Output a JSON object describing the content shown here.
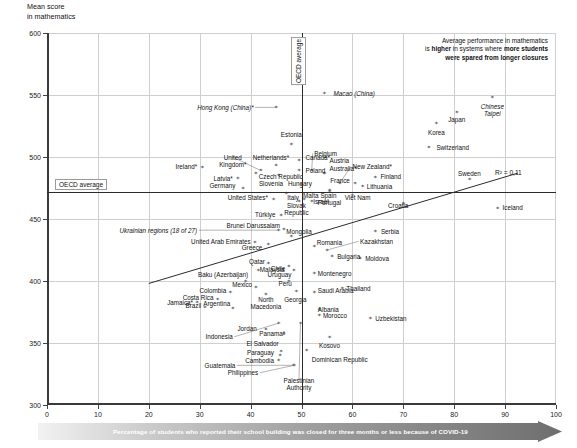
{
  "axes": {
    "y_title": "Mean score\nin mathematics",
    "y_ticks": [
      300,
      350,
      400,
      450,
      500,
      550,
      600
    ],
    "x_ticks": [
      0,
      10,
      20,
      30,
      40,
      50,
      60,
      70,
      80,
      90,
      100
    ],
    "ylim": [
      300,
      600
    ],
    "xlim": [
      0,
      100
    ]
  },
  "labels": {
    "oecd_average_y": "OECD average",
    "oecd_average_x": "OECD average",
    "r2": "R² = 0,11",
    "annotation_line1": "Average performance in mathematics",
    "annotation_line2_a": "is ",
    "annotation_line2_b": "higher",
    "annotation_line2_c": " in systems where ",
    "annotation_line2_d": "more students",
    "annotation_line3": "were spared from longer closures",
    "caption": "Percentage of students who reported their school building was closed for three months or less because of COVID-19"
  },
  "chart_data": {
    "type": "scatter",
    "title": "",
    "xlabel": "Percentage of students who reported their school building was closed for three months or less because of COVID-19",
    "ylabel": "Mean score in mathematics",
    "xlim": [
      0,
      100
    ],
    "ylim": [
      300,
      600
    ],
    "grid": true,
    "legend": "none",
    "oecd_average_x": 50.0,
    "oecd_average_y": 472,
    "trendline": {
      "x0": 20.0,
      "y0": 398,
      "x1": 92.5,
      "y1": 487,
      "r_squared": 0.11
    },
    "points": [
      {
        "name": "Hong Kong (China)*",
        "x": 45.0,
        "y": 540,
        "lx": 40.6,
        "ly": 540,
        "align": "right",
        "italic": true
      },
      {
        "name": "Macao (China)",
        "x": 54.5,
        "y": 551,
        "lx": 56.3,
        "ly": 551,
        "align": "left",
        "italic": true
      },
      {
        "name": "Chinese Taipei",
        "x": 87.5,
        "y": 548,
        "lx": 87.5,
        "ly": 541,
        "align": "center",
        "italic": true
      },
      {
        "name": "Korea",
        "x": 76.5,
        "y": 527,
        "lx": 76.5,
        "ly": 520,
        "align": "center",
        "italic": false
      },
      {
        "name": "Japan",
        "x": 80.5,
        "y": 536,
        "lx": 80.5,
        "ly": 530,
        "align": "center",
        "italic": false
      },
      {
        "name": "Estonia",
        "x": 48.0,
        "y": 510,
        "lx": 48.0,
        "ly": 518,
        "align": "center",
        "italic": false
      },
      {
        "name": "Switzerland",
        "x": 75.0,
        "y": 508,
        "lx": 76.5,
        "ly": 508,
        "align": "left",
        "italic": false
      },
      {
        "name": "Canada*",
        "x": 49.5,
        "y": 497,
        "lx": 50.8,
        "ly": 500,
        "align": "left",
        "italic": false
      },
      {
        "name": "Netherlands*",
        "x": 45.0,
        "y": 493,
        "lx": 44.0,
        "ly": 500,
        "align": "center",
        "italic": false
      },
      {
        "name": "United Kingdom*",
        "x": 42.0,
        "y": 489,
        "lx": 36.5,
        "ly": 500,
        "align": "center",
        "italic": false
      },
      {
        "name": "Ireland*",
        "x": 30.5,
        "y": 492,
        "lx": 29.5,
        "ly": 492,
        "align": "right",
        "italic": false
      },
      {
        "name": "Poland",
        "x": 49.5,
        "y": 489,
        "lx": 50.8,
        "ly": 489,
        "align": "left",
        "italic": false
      },
      {
        "name": "Belgium",
        "x": 52.0,
        "y": 489,
        "lx": 52.5,
        "ly": 503,
        "align": "left",
        "italic": false
      },
      {
        "name": "Austria",
        "x": 54.5,
        "y": 487,
        "lx": 55.5,
        "ly": 497,
        "align": "left",
        "italic": false
      },
      {
        "name": "Australia*",
        "x": 54.5,
        "y": 487,
        "lx": 55.5,
        "ly": 491,
        "align": "left",
        "italic": false
      },
      {
        "name": "New Zealand*",
        "x": 57.5,
        "y": 479,
        "lx": 60.0,
        "ly": 492,
        "align": "left",
        "italic": false
      },
      {
        "name": "Czech Republic",
        "x": 41.0,
        "y": 487,
        "lx": 41.6,
        "ly": 484,
        "align": "left",
        "italic": false
      },
      {
        "name": "Latvia*",
        "x": 37.5,
        "y": 483,
        "lx": 36.5,
        "ly": 483,
        "align": "right",
        "italic": false
      },
      {
        "name": "Germany",
        "x": 38.5,
        "y": 475,
        "lx": 37.0,
        "ly": 477,
        "align": "right",
        "italic": false
      },
      {
        "name": "Slovenia",
        "x": 45.5,
        "y": 485,
        "lx": 44.0,
        "ly": 479,
        "align": "center",
        "italic": false
      },
      {
        "name": "Hungary",
        "x": 50.0,
        "y": 478,
        "lx": 49.7,
        "ly": 479,
        "align": "center",
        "italic": false
      },
      {
        "name": "Finland",
        "x": 64.5,
        "y": 484,
        "lx": 65.5,
        "ly": 484,
        "align": "left",
        "italic": false
      },
      {
        "name": "France",
        "x": 60.5,
        "y": 479,
        "lx": 59.5,
        "ly": 481,
        "align": "right",
        "italic": false
      },
      {
        "name": "Lithuania",
        "x": 62.0,
        "y": 476,
        "lx": 62.8,
        "ly": 476,
        "align": "left",
        "italic": false
      },
      {
        "name": "Sweden",
        "x": 83.0,
        "y": 482,
        "lx": 83.0,
        "ly": 487,
        "align": "center",
        "italic": false
      },
      {
        "name": "United States*",
        "x": 44.5,
        "y": 466,
        "lx": 43.4,
        "ly": 467,
        "align": "right",
        "italic": false
      },
      {
        "name": "Italy",
        "x": 47.0,
        "y": 471,
        "lx": 47.2,
        "ly": 467,
        "align": "left",
        "italic": false
      },
      {
        "name": "Malta",
        "x": 50.5,
        "y": 466,
        "lx": 50.3,
        "ly": 469,
        "align": "left",
        "italic": false
      },
      {
        "name": "Slovak Republic",
        "x": 49.5,
        "y": 464,
        "lx": 49.0,
        "ly": 461,
        "align": "center",
        "italic": false
      },
      {
        "name": "Spain",
        "x": 55.5,
        "y": 473,
        "lx": 55.3,
        "ly": 469,
        "align": "center",
        "italic": false
      },
      {
        "name": "Israel",
        "x": 52.0,
        "y": 464,
        "lx": 52.3,
        "ly": 464,
        "align": "left",
        "italic": false
      },
      {
        "name": "Portugal",
        "x": 55.5,
        "y": 472,
        "lx": 55.5,
        "ly": 463,
        "align": "center",
        "italic": false
      },
      {
        "name": "Viet Nam",
        "x": 60.0,
        "y": 469,
        "lx": 58.5,
        "ly": 467,
        "align": "left",
        "italic": false
      },
      {
        "name": "Türkiye",
        "x": 46.0,
        "y": 453,
        "lx": 44.9,
        "ly": 454,
        "align": "right",
        "italic": false
      },
      {
        "name": "Croatia",
        "x": 70.0,
        "y": 463,
        "lx": 69.0,
        "ly": 461,
        "align": "center",
        "italic": false
      },
      {
        "name": "Iceland",
        "x": 88.5,
        "y": 459,
        "lx": 89.5,
        "ly": 459,
        "align": "left",
        "italic": false
      },
      {
        "name": "Brunei Darussalam",
        "x": 46.5,
        "y": 442,
        "lx": 45.8,
        "ly": 445,
        "align": "right",
        "italic": false
      },
      {
        "name": "Ukrainian regions (18 of 27)",
        "x": 45.5,
        "y": 441,
        "lx": 29.5,
        "ly": 441,
        "align": "right",
        "italic": true
      },
      {
        "name": "Mongolia",
        "x": 48.0,
        "y": 436,
        "lx": 47.0,
        "ly": 440,
        "align": "left",
        "italic": false
      },
      {
        "name": "United Arab Emirates",
        "x": 40.8,
        "y": 431,
        "lx": 40.0,
        "ly": 432,
        "align": "right",
        "italic": false
      },
      {
        "name": "Greece",
        "x": 43.5,
        "y": 430,
        "lx": 42.3,
        "ly": 427,
        "align": "right",
        "italic": false
      },
      {
        "name": "Serbia",
        "x": 64.5,
        "y": 440,
        "lx": 65.6,
        "ly": 440,
        "align": "left",
        "italic": false
      },
      {
        "name": "Kazakhstan",
        "x": 55.0,
        "y": 425,
        "lx": 61.5,
        "ly": 432,
        "align": "left",
        "italic": false
      },
      {
        "name": "Romania",
        "x": 52.5,
        "y": 428,
        "lx": 53.0,
        "ly": 431,
        "align": "left",
        "italic": false
      },
      {
        "name": "Bulgaria",
        "x": 56.0,
        "y": 420,
        "lx": 57.0,
        "ly": 420,
        "align": "left",
        "italic": false
      },
      {
        "name": "Moldova",
        "x": 61.5,
        "y": 418,
        "lx": 62.5,
        "ly": 418,
        "align": "left",
        "italic": false
      },
      {
        "name": "Qatar",
        "x": 43.5,
        "y": 414,
        "lx": 42.8,
        "ly": 416,
        "align": "right",
        "italic": false
      },
      {
        "name": "Malaysia",
        "x": 41.5,
        "y": 409,
        "lx": 41.8,
        "ly": 409,
        "align": "left",
        "italic": false
      },
      {
        "name": "Chile",
        "x": 47.5,
        "y": 412,
        "lx": 46.8,
        "ly": 410,
        "align": "right",
        "italic": false
      },
      {
        "name": "Uruguay",
        "x": 48.5,
        "y": 409,
        "lx": 48.0,
        "ly": 405,
        "align": "right",
        "italic": false
      },
      {
        "name": "Baku (Azerbaijan)",
        "x": 39.0,
        "y": 400,
        "lx": 39.5,
        "ly": 405,
        "align": "right",
        "italic": false
      },
      {
        "name": "Mexico",
        "x": 41.0,
        "y": 395,
        "lx": 40.3,
        "ly": 397,
        "align": "right",
        "italic": false
      },
      {
        "name": "Peru",
        "x": 47.5,
        "y": 400,
        "lx": 46.8,
        "ly": 398,
        "align": "center",
        "italic": false
      },
      {
        "name": "Montenegro",
        "x": 52.5,
        "y": 406,
        "lx": 53.2,
        "ly": 406,
        "align": "left",
        "italic": false
      },
      {
        "name": "Thailand",
        "x": 58.0,
        "y": 394,
        "lx": 58.8,
        "ly": 394,
        "align": "left",
        "italic": false
      },
      {
        "name": "Colombia",
        "x": 36.0,
        "y": 391,
        "lx": 35.2,
        "ly": 392,
        "align": "right",
        "italic": false
      },
      {
        "name": "Costa Rica",
        "x": 33.5,
        "y": 385,
        "lx": 32.7,
        "ly": 387,
        "align": "right",
        "italic": false
      },
      {
        "name": "Argentina",
        "x": 36.5,
        "y": 378,
        "lx": 36.0,
        "ly": 382,
        "align": "right",
        "italic": false
      },
      {
        "name": "Brazil",
        "x": 31.0,
        "y": 379,
        "lx": 30.3,
        "ly": 380,
        "align": "right",
        "italic": false
      },
      {
        "name": "Jamaica*",
        "x": 29.5,
        "y": 383,
        "lx": 28.7,
        "ly": 383,
        "align": "right",
        "italic": false
      },
      {
        "name": "North Macedonia",
        "x": 43.0,
        "y": 389,
        "lx": 43.0,
        "ly": 385,
        "align": "center",
        "italic": false
      },
      {
        "name": "Georgia",
        "x": 49.0,
        "y": 392,
        "lx": 48.8,
        "ly": 385,
        "align": "center",
        "italic": false
      },
      {
        "name": "Saudi Arabia",
        "x": 52.5,
        "y": 391,
        "lx": 53.2,
        "ly": 392,
        "align": "left",
        "italic": false
      },
      {
        "name": "Albania",
        "x": 53.5,
        "y": 377,
        "lx": 53.2,
        "ly": 377,
        "align": "left",
        "italic": false
      },
      {
        "name": "Morocco",
        "x": 53.5,
        "y": 372,
        "lx": 54.2,
        "ly": 372,
        "align": "left",
        "italic": false
      },
      {
        "name": "Uzbekistan",
        "x": 63.5,
        "y": 370,
        "lx": 64.5,
        "ly": 370,
        "align": "left",
        "italic": false
      },
      {
        "name": "Jordan",
        "x": 43.0,
        "y": 361,
        "lx": 41.2,
        "ly": 362,
        "align": "right",
        "italic": false
      },
      {
        "name": "Panama*",
        "x": 46.5,
        "y": 357,
        "lx": 46.8,
        "ly": 358,
        "align": "right",
        "italic": false
      },
      {
        "name": "Indonesia",
        "x": 45.5,
        "y": 366,
        "lx": 36.5,
        "ly": 355,
        "align": "right",
        "italic": false
      },
      {
        "name": "El Salvador",
        "x": 46.0,
        "y": 343,
        "lx": 45.5,
        "ly": 350,
        "align": "right",
        "italic": false
      },
      {
        "name": "Kosovo",
        "x": 55.5,
        "y": 355,
        "lx": 55.5,
        "ly": 348,
        "align": "center",
        "italic": false
      },
      {
        "name": "Paraguay",
        "x": 45.8,
        "y": 340,
        "lx": 44.6,
        "ly": 342,
        "align": "right",
        "italic": false
      },
      {
        "name": "Cambodia",
        "x": 45.5,
        "y": 336,
        "lx": 44.6,
        "ly": 336,
        "align": "right",
        "italic": false
      },
      {
        "name": "Guatemala",
        "x": 48.5,
        "y": 332,
        "lx": 37.0,
        "ly": 332,
        "align": "right",
        "italic": false
      },
      {
        "name": "Philippines",
        "x": 48.5,
        "y": 332,
        "lx": 41.5,
        "ly": 326,
        "align": "right",
        "italic": false
      },
      {
        "name": "Dominican Republic",
        "x": 51.0,
        "y": 344,
        "lx": 52.0,
        "ly": 337,
        "align": "left",
        "italic": false
      },
      {
        "name": "Palestinian Authority",
        "x": 49.8,
        "y": 366,
        "lx": 49.5,
        "ly": 320,
        "align": "center",
        "italic": false
      }
    ]
  }
}
